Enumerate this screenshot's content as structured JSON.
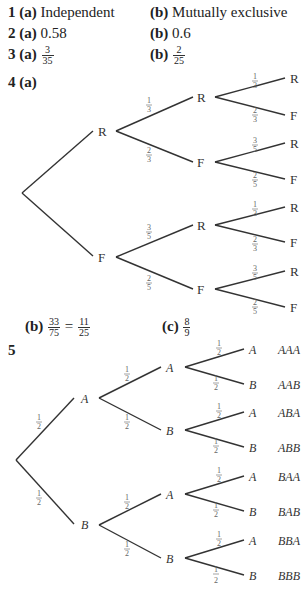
{
  "answers": [
    {
      "number": "1",
      "a_label": "(a)",
      "a_text": "Independent",
      "b_label": "(b)",
      "b_text": "Mutually exclusive"
    },
    {
      "number": "2",
      "a_label": "(a)",
      "a_text": "0.58",
      "b_label": "(b)",
      "b_text": "0.6"
    },
    {
      "number": "3",
      "a_label": "(a)",
      "a_num": "3",
      "a_den": "35",
      "b_label": "(b)",
      "b_num": "2",
      "b_den": "25"
    },
    {
      "number": "4",
      "a_label": "(a)",
      "b_label": "(b)",
      "b_num1": "33",
      "b_den1": "75",
      "b_eq": "=",
      "b_num2": "11",
      "b_den2": "25",
      "c_label": "(c)",
      "c_num": "8",
      "c_den": "9"
    },
    {
      "number": "5"
    }
  ],
  "tree4": {
    "level1": [
      "R",
      "F"
    ],
    "level2": [
      "R",
      "F",
      "R",
      "F"
    ],
    "level3": [
      "R",
      "F",
      "R",
      "F",
      "R",
      "F",
      "R",
      "F"
    ],
    "probs_l2": [
      [
        "1",
        "3"
      ],
      [
        "2",
        "3"
      ],
      [
        "3",
        "5"
      ],
      [
        "2",
        "5"
      ]
    ],
    "probs_l3": [
      [
        "1",
        "3"
      ],
      [
        "2",
        "3"
      ],
      [
        "3",
        "5"
      ],
      [
        "2",
        "5"
      ],
      [
        "1",
        "3"
      ],
      [
        "2",
        "3"
      ],
      [
        "3",
        "5"
      ],
      [
        "2",
        "5"
      ]
    ]
  },
  "tree5": {
    "level1": [
      "A",
      "B"
    ],
    "level2": [
      "A",
      "B",
      "A",
      "B"
    ],
    "level3": [
      "A",
      "B",
      "A",
      "B",
      "A",
      "B",
      "A",
      "B"
    ],
    "outcomes": [
      "AAA",
      "AAB",
      "ABA",
      "ABB",
      "BAA",
      "BAB",
      "BBA",
      "BBB"
    ],
    "prob": [
      "1",
      "2"
    ]
  }
}
